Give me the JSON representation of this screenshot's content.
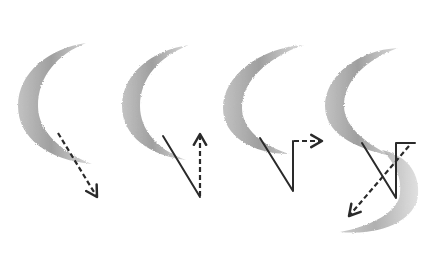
{
  "figure": {
    "colors": {
      "background": "#ffffff",
      "shading_dark": "#8a8a8a",
      "shading_light": "#c8c8c8",
      "line": "#2a2a2a"
    },
    "panels": [
      {
        "id": 1,
        "shape": "crescent",
        "guide": "dashed arrow pointing down-right"
      },
      {
        "id": 2,
        "shape": "crescent",
        "guide": "solid diagonal line then dashed arrow pointing up"
      },
      {
        "id": 3,
        "shape": "crescent",
        "guide": "solid diagonal, vertical line, dashed arrow pointing right"
      },
      {
        "id": 4,
        "shape": "S-curve",
        "guide": "solid diagonal, vertical and flag line, dashed arrow pointing down-left"
      }
    ]
  }
}
